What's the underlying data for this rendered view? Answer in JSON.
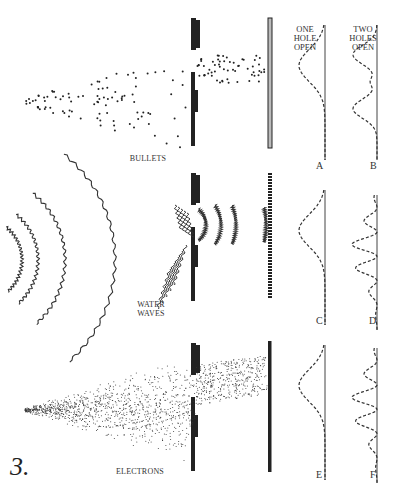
{
  "figure_number": "3.",
  "headers": {
    "one_hole": [
      "ONE",
      "HOLE",
      "OPEN"
    ],
    "two_holes": [
      "TWO",
      "HOLES",
      "OPEN"
    ]
  },
  "panels": [
    {
      "name": "bullets",
      "label": "BULLETS",
      "letters": [
        "A",
        "B"
      ]
    },
    {
      "name": "water-waves",
      "label_lines": [
        "WATER",
        "WAVES"
      ],
      "letters": [
        "C",
        "D"
      ]
    },
    {
      "name": "electrons",
      "label": "ELECTRONS",
      "letters": [
        "E",
        "F"
      ]
    }
  ],
  "colors": {
    "ink": "#222222",
    "screen_fill": "#bbbbbb",
    "background": "#ffffff"
  }
}
